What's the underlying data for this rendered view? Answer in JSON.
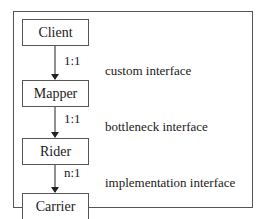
{
  "diagram": {
    "boxes": [
      {
        "label": "Client"
      },
      {
        "label": "Mapper"
      },
      {
        "label": "Rider"
      },
      {
        "label": "Carrier"
      }
    ],
    "links": [
      {
        "from": "Client",
        "to": "Mapper",
        "multiplicity": "1:1",
        "interface": "custom interface"
      },
      {
        "from": "Mapper",
        "to": "Rider",
        "multiplicity": "1:1",
        "interface": "bottleneck interface"
      },
      {
        "from": "Rider",
        "to": "Carrier",
        "multiplicity": "n:1",
        "interface": "implementation interface"
      }
    ]
  }
}
